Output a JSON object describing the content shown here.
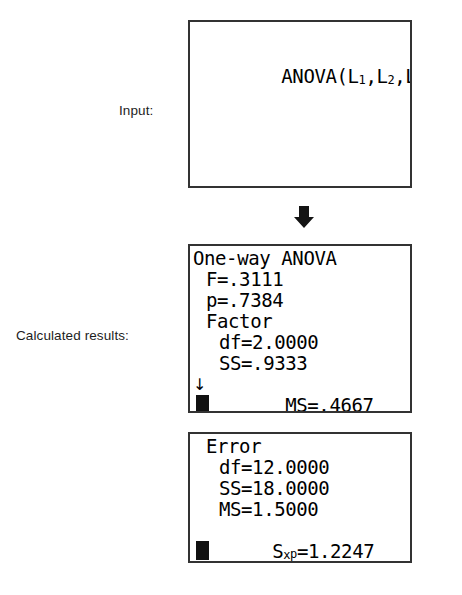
{
  "labels": {
    "input": "Input:",
    "results": "Calculated results:"
  },
  "flow": {
    "arrow_icon": "arrow-down-icon"
  },
  "screens": [
    {
      "name": "input-screen",
      "lines": [
        {
          "segments": [
            {
              "text": "ANOVA(L",
              "style": "normal"
            },
            {
              "text": "1",
              "style": "sub"
            },
            {
              "text": ",L",
              "style": "normal"
            },
            {
              "text": "2",
              "style": "sub"
            },
            {
              "text": ",L",
              "style": "normal"
            },
            {
              "text": "3",
              "style": "sub"
            },
            {
              "text": ")",
              "style": "normal"
            }
          ],
          "plain": "ANOVA(L1,L2,L3)",
          "cursor": true
        }
      ]
    },
    {
      "name": "factor-results-screen",
      "lines": [
        {
          "plain": "One-way ANOVA",
          "indent": 0,
          "marker": ""
        },
        {
          "plain": "F=.3111",
          "indent": 1,
          "marker": ""
        },
        {
          "plain": "p=.7384",
          "indent": 1,
          "marker": ""
        },
        {
          "plain": "Factor",
          "indent": 1,
          "marker": ""
        },
        {
          "plain": "df=2.0000",
          "indent": 2,
          "marker": ""
        },
        {
          "plain": "SS=.9333",
          "indent": 2,
          "marker": ""
        },
        {
          "plain": "MS=.4667",
          "indent": 2,
          "marker": "↓"
        }
      ],
      "cursor_block": true
    },
    {
      "name": "error-results-screen",
      "lines": [
        {
          "plain": "Error",
          "indent": 1,
          "marker": ""
        },
        {
          "plain": "df=12.0000",
          "indent": 2,
          "marker": ""
        },
        {
          "plain": "SS=18.0000",
          "indent": 2,
          "marker": ""
        },
        {
          "plain": "MS=1.5000",
          "indent": 2,
          "marker": ""
        },
        {
          "segments": [
            {
              "text": "S",
              "style": "normal"
            },
            {
              "text": "x",
              "style": "sub"
            },
            {
              "text": "p",
              "style": "subhi"
            },
            {
              "text": "=1.2247",
              "style": "normal"
            }
          ],
          "plain": "Sxp=1.2247",
          "indent": 1,
          "marker": ""
        }
      ],
      "cursor_block": true
    }
  ],
  "colors": {
    "screen_border": "#333333",
    "text": "#000000",
    "label_text": "#1d1d1d",
    "arrow": "#141414"
  }
}
